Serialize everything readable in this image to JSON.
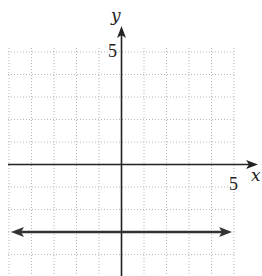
{
  "chart_data": {
    "type": "line",
    "title": "",
    "xlabel": "x",
    "ylabel": "y",
    "xlim": [
      -5,
      5
    ],
    "ylim": [
      -5,
      5
    ],
    "grid": true,
    "grid_style": "dotted",
    "tick_labels": {
      "x": [
        {
          "value": 5,
          "label": "5"
        }
      ],
      "y": [
        {
          "value": 5,
          "label": "5"
        }
      ]
    },
    "series": [
      {
        "name": "horizontal line",
        "equation": "y = -3",
        "x": [
          -5,
          5
        ],
        "y": [
          -3,
          -3
        ],
        "arrows": "both"
      }
    ]
  },
  "labels": {
    "x_axis": "x",
    "y_axis": "y",
    "x_tick": "5",
    "y_tick": "5"
  },
  "colors": {
    "axis": "#222222",
    "line": "#333333",
    "grid": "#b8b8b8"
  }
}
